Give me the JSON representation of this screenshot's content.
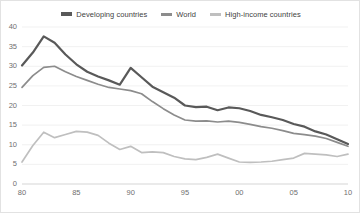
{
  "legend": {
    "position": "top",
    "entries": [
      {
        "label": "Developing countries",
        "color": "#595959",
        "icon": "line-swatch-icon"
      },
      {
        "label": "World",
        "color": "#8c8c8c",
        "icon": "line-swatch-icon"
      },
      {
        "label": "High-income countries",
        "color": "#bfbfbf",
        "icon": "line-swatch-icon"
      }
    ]
  },
  "chart_data": {
    "type": "line",
    "title": "",
    "subtitle": "",
    "xlabel": "",
    "ylabel": "",
    "grid": true,
    "gridlines": "horizontal",
    "ylim": [
      0,
      40
    ],
    "yticks": [
      0,
      5,
      10,
      15,
      20,
      25,
      30,
      35,
      40
    ],
    "ytick_labels": [
      "0",
      "5",
      "10",
      "15",
      "20",
      "25",
      "30",
      "35",
      "40"
    ],
    "xlim": [
      1980,
      2010
    ],
    "xticks": [
      1980,
      1985,
      1990,
      1995,
      2000,
      2005,
      2010
    ],
    "xtick_labels": [
      "80",
      "85",
      "90",
      "95",
      "00",
      "05",
      "10"
    ],
    "x": [
      1980,
      1981,
      1982,
      1983,
      1984,
      1985,
      1986,
      1987,
      1988,
      1989,
      1990,
      1991,
      1992,
      1993,
      1994,
      1995,
      1996,
      1997,
      1998,
      1999,
      2000,
      2001,
      2002,
      2003,
      2004,
      2005,
      2006,
      2007,
      2008,
      2009,
      2010
    ],
    "series": [
      {
        "name": "Developing countries",
        "color": "#595959",
        "values": [
          30.2,
          33.5,
          37.6,
          36.0,
          33.0,
          30.5,
          28.6,
          27.4,
          26.4,
          25.3,
          29.6,
          27.2,
          24.8,
          23.4,
          22.0,
          20.0,
          19.6,
          19.7,
          18.8,
          19.5,
          19.3,
          18.6,
          17.6,
          17.0,
          16.3,
          15.3,
          14.6,
          13.4,
          12.6,
          11.4,
          10.2
        ]
      },
      {
        "name": "World",
        "color": "#8c8c8c",
        "values": [
          24.6,
          27.6,
          29.7,
          30.0,
          28.6,
          27.4,
          26.4,
          25.4,
          24.6,
          24.2,
          23.8,
          23.0,
          21.0,
          19.2,
          17.6,
          16.3,
          16.0,
          16.1,
          15.8,
          16.0,
          15.7,
          15.2,
          14.6,
          14.2,
          13.6,
          12.9,
          12.6,
          12.2,
          11.6,
          10.6,
          9.6
        ]
      },
      {
        "name": "High-income countries",
        "color": "#bfbfbf",
        "values": [
          5.6,
          9.8,
          13.2,
          11.8,
          12.6,
          13.4,
          13.2,
          12.4,
          10.4,
          8.8,
          9.6,
          8.0,
          8.2,
          8.0,
          7.0,
          6.4,
          6.2,
          6.8,
          7.6,
          6.6,
          5.6,
          5.5,
          5.6,
          5.8,
          6.2,
          6.6,
          7.8,
          7.6,
          7.4,
          7.0,
          7.6
        ]
      }
    ]
  }
}
